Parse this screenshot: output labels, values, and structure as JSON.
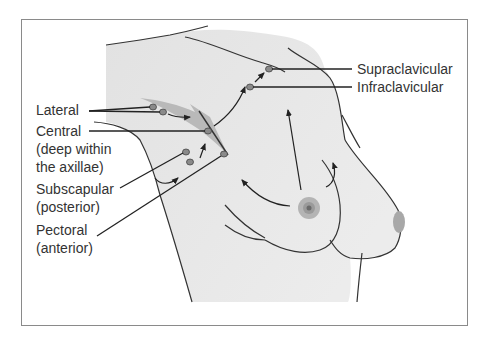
{
  "figure": {
    "colors": {
      "skin": "#e2e2e2",
      "outline": "#333333",
      "node_fill": "#8a8a8a",
      "axilla_shade": "#b9b9b9",
      "areola": "#a8a8a8",
      "frame": "#8a8a8a"
    },
    "labels": {
      "supraclavicular": "Supraclavicular",
      "infraclavicular": "Infraclavicular",
      "lateral": "Lateral",
      "central_line1": "Central",
      "central_line2": "(deep within",
      "central_line3": "the axillae)",
      "subscapular_line1": "Subscapular",
      "subscapular_line2": "(posterior)",
      "pectoral_line1": "Pectoral",
      "pectoral_line2": "(anterior)"
    }
  }
}
